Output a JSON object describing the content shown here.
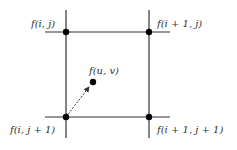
{
  "diagram": {
    "colors": {
      "line": "#333333",
      "point": "#000000",
      "arrow": "#333333",
      "background": "#ffffff"
    },
    "labels": {
      "top_left": "f(i, j)",
      "top_right": "f(i + 1, j)",
      "bottom_left": "f(i, j + 1)",
      "bottom_right": "f(i + 1, j + 1)",
      "center": "f(u, v)"
    },
    "nodes": [
      {
        "id": "top_left",
        "x": 66,
        "y": 32
      },
      {
        "id": "top_right",
        "x": 149,
        "y": 32
      },
      {
        "id": "bottom_left",
        "x": 66,
        "y": 117
      },
      {
        "id": "bottom_right",
        "x": 149,
        "y": 117
      },
      {
        "id": "center",
        "x": 93,
        "y": 82
      }
    ],
    "edges": [
      {
        "from": "bottom_left",
        "to": "center",
        "style": "dashed-arrow"
      }
    ]
  }
}
